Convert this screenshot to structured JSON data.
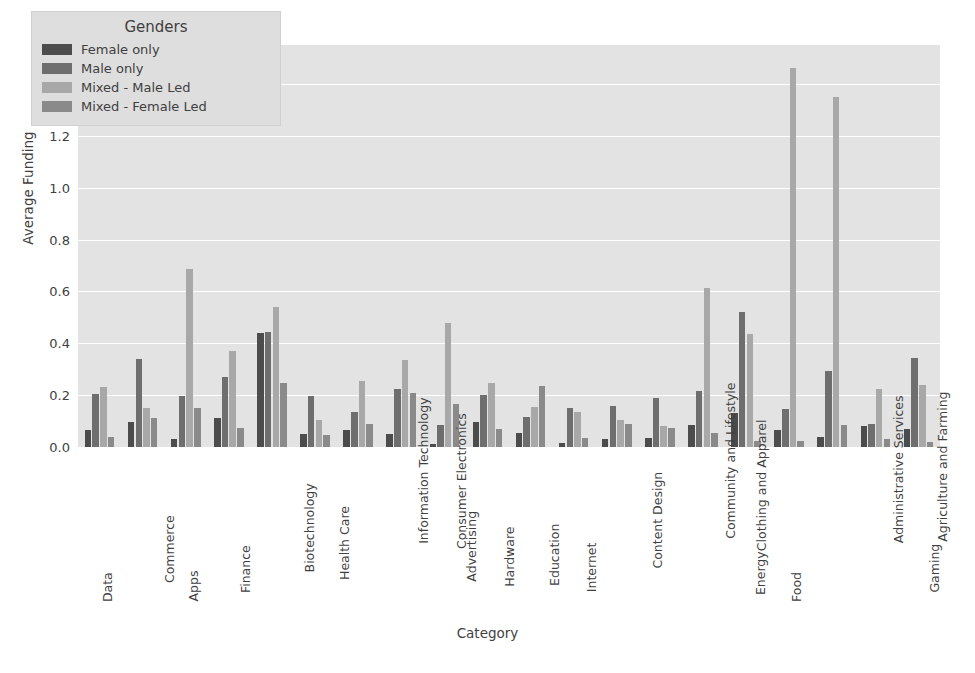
{
  "chart_data": {
    "type": "bar",
    "title": "",
    "xlabel": "Category",
    "ylabel": "Average Funding",
    "y_offset_text": "1e8",
    "y_scale": 100000000.0,
    "ylim": [
      0,
      1.55
    ],
    "yticks": [
      "0.0",
      "0.2",
      "0.4",
      "0.6",
      "0.8",
      "1.0",
      "1.2",
      "1.4"
    ],
    "ytick_values": [
      0.0,
      0.2,
      0.4,
      0.6,
      0.8,
      1.0,
      1.2,
      1.4
    ],
    "grid": true,
    "legend_position": "upper left",
    "legend_title": "Genders",
    "categories": [
      "Data",
      "Commerce",
      "Apps",
      "Finance",
      "Biotechnology",
      "Health Care",
      "Information Technology",
      "Consumer Electronics",
      "Advertising",
      "Hardware",
      "Education",
      "Internet",
      "Content Design",
      "Community and Lifestyle",
      "Clothing and Apparel",
      "Energy",
      "Food",
      "Administrative Services",
      "Agriculture and Farming",
      "Gaming"
    ],
    "series": [
      {
        "name": "Female only",
        "color": "#4c4c4c",
        "values": [
          0.065,
          0.095,
          0.03,
          0.11,
          0.44,
          0.05,
          0.065,
          0.05,
          0.01,
          0.095,
          0.055,
          0.015,
          0.03,
          0.035,
          0.085,
          0.13,
          0.065,
          0.04,
          0.08,
          0.07
        ]
      },
      {
        "name": "Male only",
        "color": "#6e6e6e",
        "values": [
          0.205,
          0.34,
          0.195,
          0.27,
          0.445,
          0.195,
          0.135,
          0.225,
          0.085,
          0.2,
          0.115,
          0.15,
          0.16,
          0.19,
          0.215,
          0.52,
          0.145,
          0.295,
          0.09,
          0.345
        ]
      },
      {
        "name": "Mixed - Male Led",
        "color": "#a8a8a8",
        "values": [
          0.23,
          0.15,
          0.685,
          0.37,
          0.54,
          0.105,
          0.255,
          0.335,
          0.48,
          0.245,
          0.155,
          0.135,
          0.105,
          0.08,
          0.615,
          0.435,
          1.46,
          1.35,
          0.225,
          0.24
        ]
      },
      {
        "name": "Mixed - Female Led",
        "color": "#8a8a8a",
        "values": [
          0.04,
          0.11,
          0.15,
          0.075,
          0.245,
          0.045,
          0.09,
          0.21,
          0.165,
          0.07,
          0.235,
          0.035,
          0.09,
          0.075,
          0.055,
          0.025,
          0.025,
          0.085,
          0.03,
          0.02
        ]
      }
    ]
  },
  "legend": {
    "title": "Genders",
    "entries": [
      "Female only",
      "Male only",
      "Mixed - Male Led",
      "Mixed - Female Led"
    ]
  },
  "axes": {
    "y_label": "Average Funding",
    "x_label": "Category",
    "y_offset": "1e8"
  }
}
